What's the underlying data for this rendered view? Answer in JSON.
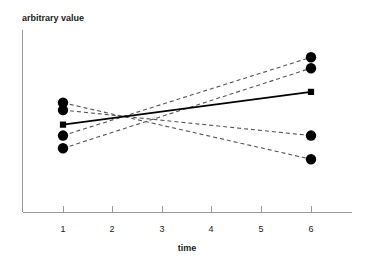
{
  "chart_data": {
    "type": "line",
    "title": "",
    "xlabel": "time",
    "ylabel": "arbitrary value",
    "xlim": [
      0.45,
      6.55
    ],
    "ylim": [
      0,
      10
    ],
    "grid": false,
    "legend": null,
    "x_ticks": [
      1,
      2,
      3,
      4,
      5,
      6
    ],
    "x_tick_labels": [
      "1",
      "2",
      "3",
      "4",
      "5",
      "6"
    ],
    "y_ticks": [],
    "y_tick_labels": [],
    "x": [
      1,
      6
    ],
    "series": [
      {
        "name": "subject-1",
        "style": "dashed",
        "marker": "circle",
        "values": [
          6.0,
          2.9
        ],
        "x": [
          1,
          6
        ]
      },
      {
        "name": "subject-2",
        "style": "dashed",
        "marker": "circle",
        "values": [
          5.6,
          4.2
        ],
        "x": [
          1,
          6
        ]
      },
      {
        "name": "subject-3",
        "style": "dashed",
        "marker": "circle",
        "values": [
          4.2,
          8.5
        ],
        "x": [
          1,
          6
        ]
      },
      {
        "name": "subject-4",
        "style": "dashed",
        "marker": "circle",
        "values": [
          3.5,
          7.9
        ],
        "x": [
          1,
          6
        ]
      },
      {
        "name": "mean",
        "style": "solid",
        "marker": "square",
        "values": [
          4.8,
          6.6
        ],
        "x": [
          1,
          6
        ]
      }
    ],
    "annotations": []
  },
  "axes": {
    "y_axis_title": "arbitrary value",
    "x_axis_title": "time"
  },
  "geometry": {
    "plot_left_px": 22,
    "plot_bottom_px": 212,
    "plot_top_px": 30,
    "plot_right_px": 352,
    "x1_px": 63,
    "x6_px": 311,
    "tick_px": [
      63,
      112,
      162,
      211,
      261,
      311
    ],
    "left_points_px": [
      107,
      123,
      146,
      169,
      186
    ],
    "right_points_px": [
      53,
      72,
      95,
      118,
      138
    ]
  },
  "colors": {
    "line_dashed": "#555555",
    "line_solid": "#000000",
    "marker": "#000000",
    "axis": "#9a9a9a",
    "text": "#1a1a1a",
    "background": "#ffffff"
  }
}
